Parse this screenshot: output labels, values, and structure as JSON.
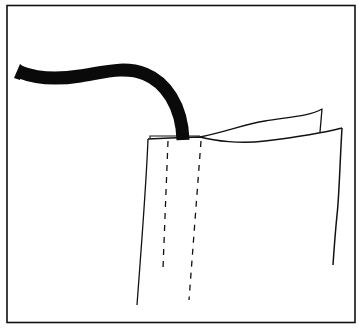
{
  "diagram": {
    "colors": {
      "background": "#ffffff",
      "ink": "#111111"
    },
    "elements": [
      {
        "name": "frame-border",
        "type": "rectangle"
      },
      {
        "name": "cord",
        "type": "thick-curve"
      },
      {
        "name": "casing-front",
        "type": "outline"
      },
      {
        "name": "casing-back-flap",
        "type": "outline"
      },
      {
        "name": "stitch-line-left",
        "type": "dashed-line"
      },
      {
        "name": "stitch-line-right",
        "type": "dashed-line"
      }
    ]
  }
}
